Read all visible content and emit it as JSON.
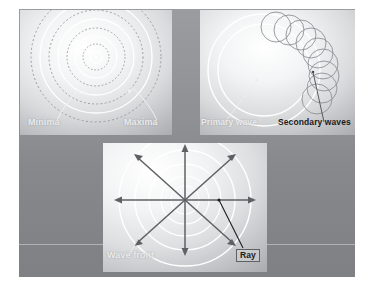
{
  "figure": {
    "background_color": "#8e9093",
    "canvas": {
      "width": 370,
      "height": 286
    }
  },
  "panels": [
    {
      "id": "interference",
      "name": "Interference pattern panel",
      "labels": {
        "minima": "Minima",
        "maxima": "Maxima"
      },
      "description": "Concentric circles alternating solid and dashed about a central source",
      "ring_colors": {
        "solid": "#ffffff",
        "dashed": "#9fa1a4"
      },
      "rings": [
        {
          "radius": 6,
          "style": "solid"
        },
        {
          "radius": 13,
          "style": "dashed"
        },
        {
          "radius": 21,
          "style": "solid"
        },
        {
          "radius": 29,
          "style": "dashed"
        },
        {
          "radius": 38,
          "style": "solid"
        },
        {
          "radius": 47,
          "style": "dashed"
        },
        {
          "radius": 56,
          "style": "solid"
        },
        {
          "radius": 65,
          "style": "dashed"
        }
      ]
    },
    {
      "id": "huygens",
      "name": "Huygens principle panel",
      "labels": {
        "primary": "Primary wave",
        "secondary": "Secondary waves"
      },
      "description": "A large primary wavefront circle with small secondary wavelet circles along its upper-right arc",
      "primary_radii": [
        46,
        56
      ],
      "secondary_wavelet_radius": 15,
      "secondary_wavelet_count": 9
    },
    {
      "id": "wavefront-ray",
      "name": "Wavefront and ray panel",
      "labels": {
        "wave_front": "Wave front",
        "ray": "Ray"
      },
      "description": "Eight rays radiating from a point source crossing concentric circular wavefronts",
      "ray_count": 8,
      "ray_angles_deg": [
        0,
        45,
        90,
        135,
        180,
        225,
        270,
        315
      ],
      "wavefront_radii": [
        14,
        24,
        36,
        50,
        66
      ],
      "ray_color": "#5e6063",
      "wavefront_color": "#ffffff"
    }
  ]
}
